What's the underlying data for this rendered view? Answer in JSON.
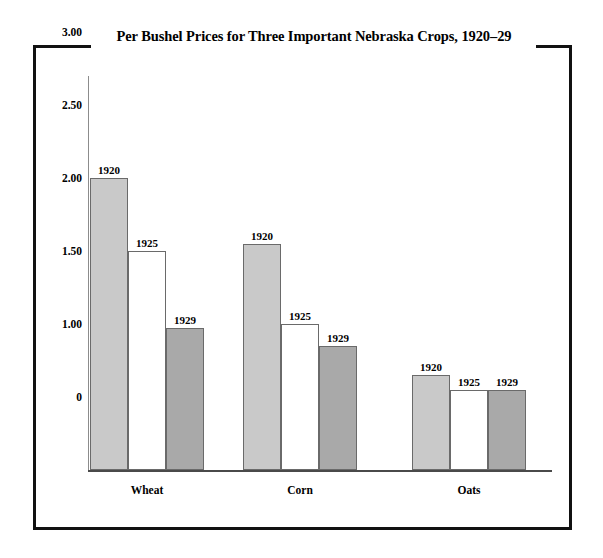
{
  "chart_data": {
    "type": "bar",
    "title": "Per Bushel Prices for Three Important Nebraska Crops, 1920–29",
    "xlabel": "",
    "ylabel": "",
    "categories": [
      "Wheat",
      "Corn",
      "Oats"
    ],
    "series": [
      {
        "name": "1920",
        "values": [
          2.0,
          1.55,
          0.65
        ],
        "color": "#c9c9c9"
      },
      {
        "name": "1925",
        "values": [
          1.5,
          1.0,
          0.55
        ],
        "color": "#ffffff"
      },
      {
        "name": "1929",
        "values": [
          0.97,
          0.85,
          0.55
        ],
        "color": "#a9a9a9"
      }
    ],
    "ylim": [
      0,
      3.25
    ],
    "yticks": [
      {
        "value": 3.0,
        "label": "3.00"
      },
      {
        "value": 2.5,
        "label": "2.50"
      },
      {
        "value": 2.0,
        "label": "2.00"
      },
      {
        "value": 1.5,
        "label": "1.50"
      },
      {
        "value": 1.0,
        "label": "1.00"
      },
      {
        "value": 0.5,
        "label": "0"
      }
    ],
    "grid": false,
    "legend": "none",
    "bar_value_labels": true
  },
  "figure": {
    "title": "Per Bushel Prices for Three Important Nebraska Crops, 1920–29",
    "frame": true
  },
  "ylabels": [
    {
      "text": "3.00"
    },
    {
      "text": "2.50"
    },
    {
      "text": "2.00"
    },
    {
      "text": "1.50"
    },
    {
      "text": "1.00"
    },
    {
      "text": "0"
    }
  ],
  "groups": [
    {
      "category": "Wheat",
      "bars": [
        {
          "label": "1920",
          "value": "2.00",
          "tone": "tone-light"
        },
        {
          "label": "1925",
          "value": "1.50",
          "tone": "tone-white"
        },
        {
          "label": "1929",
          "value": "0.97",
          "tone": "tone-dark"
        }
      ]
    },
    {
      "category": "Corn",
      "bars": [
        {
          "label": "1920",
          "value": "1.55",
          "tone": "tone-light"
        },
        {
          "label": "1925",
          "value": "1.00",
          "tone": "tone-white"
        },
        {
          "label": "1929",
          "value": "0.85",
          "tone": "tone-dark"
        }
      ]
    },
    {
      "category": "Oats",
      "bars": [
        {
          "label": "1920",
          "value": "0.65",
          "tone": "tone-light"
        },
        {
          "label": "1925",
          "value": "0.55",
          "tone": "tone-white"
        },
        {
          "label": "1929",
          "value": "0.55",
          "tone": "tone-dark"
        }
      ]
    }
  ],
  "categories": [
    {
      "label": "Wheat"
    },
    {
      "label": "Corn"
    },
    {
      "label": "Oats"
    }
  ]
}
